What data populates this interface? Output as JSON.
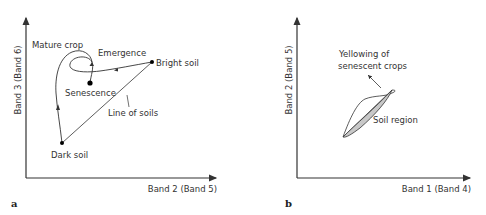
{
  "panel_a": {
    "panel_label": "a",
    "y_axis_label": "Band 3 (Band 6)",
    "x_axis_label": "Band 2 (Band 5)",
    "annotations": {
      "mature_crop": "Mature crop",
      "emergence": "Emergence",
      "bright_soil": "Bright soil",
      "senescence": "Senescence",
      "line_of_soils": "Line of soils",
      "dark_soil": "Dark soil"
    }
  },
  "panel_b": {
    "panel_label": "b",
    "y_axis_label": "Band 2 (Band 5)",
    "x_axis_label": "Band 1 (Band 4)",
    "annotations": {
      "yellowing_line1": "Yellowing of",
      "yellowing_line2": "senescent crops",
      "soil_region": "Soil region"
    }
  },
  "colors": {
    "line": "#333333",
    "soil_region_fill": "#c8c8c8"
  }
}
